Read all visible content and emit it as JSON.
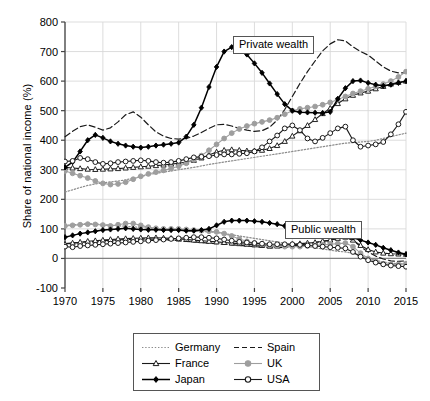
{
  "chart_data": {
    "type": "line",
    "title": "",
    "xlabel": "",
    "ylabel": "Share of national income (%)",
    "xlim": [
      1970,
      2015
    ],
    "ylim": [
      -100,
      800
    ],
    "ytick_values": [
      -100,
      0,
      100,
      200,
      300,
      400,
      500,
      600,
      700,
      800
    ],
    "ytick_labels": [
      "-100",
      "0",
      "100",
      "200",
      "300",
      "400",
      "500",
      "600",
      "700",
      "800"
    ],
    "xtick_values": [
      1970,
      1975,
      1980,
      1985,
      1990,
      1995,
      2000,
      2005,
      2010,
      2015
    ],
    "xtick_labels": [
      "1970",
      "1975",
      "1980",
      "1985",
      "1990",
      "1995",
      "2000",
      "2005",
      "2010",
      "2015"
    ],
    "grid": true,
    "legend_position": "below-center",
    "annotations": [
      {
        "text": "Private wealth",
        "x": 1995,
        "y": 690,
        "name": "private-wealth-label"
      },
      {
        "text": "Public wealth",
        "x": 2002,
        "y": 170,
        "name": "public-wealth-label"
      }
    ],
    "x": [
      1970,
      1971,
      1972,
      1973,
      1974,
      1975,
      1976,
      1977,
      1978,
      1979,
      1980,
      1981,
      1982,
      1983,
      1984,
      1985,
      1986,
      1987,
      1988,
      1989,
      1990,
      1991,
      1992,
      1993,
      1994,
      1995,
      1996,
      1997,
      1998,
      1999,
      2000,
      2001,
      2002,
      2003,
      2004,
      2005,
      2006,
      2007,
      2008,
      2009,
      2010,
      2011,
      2012,
      2013,
      2014,
      2015
    ],
    "groups": [
      {
        "name": "Private wealth",
        "series": [
          {
            "name": "Germany",
            "style": "dotted",
            "color": "#8c8c8c",
            "marker": "none",
            "values": [
              225,
              232,
              240,
              247,
              252,
              256,
              259,
              262,
              266,
              271,
              277,
              283,
              288,
              292,
              296,
              300,
              304,
              308,
              313,
              318,
              322,
              326,
              330,
              334,
              338,
              342,
              346,
              350,
              354,
              358,
              362,
              366,
              370,
              374,
              378,
              382,
              386,
              390,
              392,
              394,
              396,
              400,
              406,
              412,
              418,
              424
            ]
          },
          {
            "name": "Spain",
            "style": "dashed",
            "color": "#1a1a1a",
            "marker": "none",
            "values": [
              412,
              430,
              446,
              452,
              444,
              434,
              442,
              462,
              486,
              496,
              478,
              452,
              428,
              414,
              406,
              404,
              406,
              414,
              426,
              440,
              452,
              454,
              448,
              440,
              434,
              430,
              432,
              444,
              468,
              504,
              548,
              592,
              632,
              668,
              702,
              726,
              740,
              736,
              716,
              700,
              688,
              668,
              648,
              634,
              628,
              628
            ]
          },
          {
            "name": "France",
            "style": "solid",
            "color": "#1a1a1a",
            "marker": "triangle-open",
            "values": [
              308,
              306,
              304,
              302,
              301,
              302,
              303,
              304,
              306,
              308,
              310,
              312,
              314,
              316,
              319,
              322,
              326,
              332,
              340,
              350,
              360,
              366,
              368,
              366,
              364,
              364,
              366,
              372,
              382,
              396,
              414,
              432,
              450,
              470,
              490,
              508,
              524,
              540,
              552,
              560,
              566,
              574,
              582,
              590,
              596,
              600
            ]
          },
          {
            "name": "UK",
            "style": "solid",
            "color": "#9e9e9e",
            "marker": "circle-filled",
            "values": [
              296,
              288,
              280,
              272,
              262,
              254,
              250,
              252,
              258,
              268,
              278,
              286,
              292,
              298,
              304,
              312,
              322,
              334,
              348,
              366,
              386,
              406,
              424,
              438,
              448,
              456,
              462,
              468,
              476,
              488,
              500,
              506,
              510,
              514,
              520,
              528,
              538,
              548,
              558,
              566,
              574,
              582,
              590,
              600,
              614,
              632
            ]
          },
          {
            "name": "Japan",
            "style": "solid",
            "color": "#000000",
            "marker": "diamond-filled",
            "values": [
              308,
              326,
              362,
              400,
              418,
              408,
              396,
              388,
              382,
              378,
              375,
              378,
              382,
              385,
              388,
              392,
              412,
              452,
              510,
              580,
              648,
              700,
              715,
              710,
              690,
              660,
              628,
              592,
              556,
              522,
              500,
              495,
              494,
              493,
              492,
              496,
              540,
              576,
              600,
              602,
              594,
              588,
              584,
              588,
              594,
              600
            ]
          },
          {
            "name": "USA",
            "style": "solid",
            "color": "#1a1a1a",
            "marker": "circle-open",
            "values": [
              328,
              330,
              340,
              336,
              326,
              320,
              322,
              326,
              328,
              330,
              332,
              330,
              326,
              324,
              326,
              330,
              336,
              342,
              344,
              346,
              350,
              352,
              352,
              354,
              356,
              362,
              376,
              396,
              416,
              440,
              450,
              434,
              406,
              396,
              408,
              424,
              440,
              446,
              400,
              378,
              382,
              386,
              394,
              420,
              454,
              496
            ]
          }
        ]
      },
      {
        "name": "Public wealth",
        "series": [
          {
            "name": "Germany",
            "style": "dotted",
            "color": "#8c8c8c",
            "marker": "none",
            "values": [
              112,
              114,
              116,
              118,
              117,
              115,
              113,
              111,
              109,
              107,
              105,
              102,
              100,
              98,
              96,
              94,
              93,
              92,
              91,
              90,
              88,
              84,
              80,
              76,
              72,
              68,
              64,
              60,
              56,
              52,
              48,
              44,
              40,
              36,
              32,
              28,
              24,
              22,
              18,
              8,
              0,
              -6,
              -12,
              -16,
              -18,
              -18
            ]
          },
          {
            "name": "Spain",
            "style": "dashed",
            "color": "#1a1a1a",
            "marker": "none",
            "values": [
              50,
              52,
              54,
              56,
              58,
              60,
              62,
              63,
              64,
              65,
              66,
              66,
              65,
              64,
              62,
              60,
              58,
              56,
              54,
              52,
              50,
              48,
              46,
              44,
              42,
              40,
              38,
              36,
              36,
              38,
              42,
              46,
              50,
              54,
              58,
              62,
              68,
              72,
              62,
              40,
              22,
              8,
              -2,
              -8,
              -10,
              -8
            ]
          },
          {
            "name": "France",
            "style": "solid",
            "color": "#1a1a1a",
            "marker": "triangle-open",
            "values": [
              48,
              52,
              55,
              58,
              60,
              62,
              64,
              66,
              67,
              68,
              69,
              70,
              70,
              69,
              68,
              66,
              64,
              62,
              60,
              58,
              56,
              54,
              52,
              50,
              48,
              46,
              44,
              42,
              42,
              44,
              48,
              50,
              52,
              54,
              58,
              62,
              68,
              72,
              62,
              44,
              30,
              22,
              18,
              16,
              15,
              14
            ]
          },
          {
            "name": "UK",
            "style": "solid",
            "color": "#9e9e9e",
            "marker": "circle-filled",
            "values": [
              110,
              112,
              114,
              116,
              115,
              113,
              110,
              114,
              118,
              118,
              112,
              106,
              102,
              100,
              100,
              100,
              98,
              96,
              94,
              92,
              90,
              84,
              76,
              66,
              58,
              52,
              48,
              44,
              42,
              40,
              40,
              40,
              42,
              44,
              46,
              48,
              50,
              52,
              40,
              18,
              0,
              -10,
              -18,
              -20,
              -20,
              -18
            ]
          },
          {
            "name": "Japan",
            "style": "solid",
            "color": "#000000",
            "marker": "diamond-filled",
            "values": [
              72,
              78,
              84,
              88,
              92,
              96,
              98,
              100,
              102,
              100,
              98,
              97,
              97,
              96,
              96,
              96,
              94,
              94,
              96,
              100,
              112,
              124,
              128,
              128,
              128,
              126,
              124,
              120,
              116,
              110,
              104,
              98,
              94,
              90,
              86,
              82,
              80,
              78,
              70,
              62,
              54,
              46,
              36,
              28,
              20,
              14
            ]
          },
          {
            "name": "USA",
            "style": "solid",
            "color": "#1a1a1a",
            "marker": "circle-open",
            "values": [
              40,
              38,
              42,
              44,
              46,
              48,
              50,
              52,
              54,
              56,
              58,
              60,
              62,
              64,
              66,
              68,
              70,
              72,
              72,
              70,
              68,
              64,
              60,
              56,
              54,
              52,
              50,
              48,
              48,
              48,
              48,
              46,
              44,
              42,
              40,
              38,
              36,
              34,
              22,
              6,
              -6,
              -14,
              -20,
              -24,
              -26,
              -28
            ]
          }
        ]
      }
    ]
  },
  "legend": {
    "items": [
      {
        "label": "Germany",
        "marker": "none",
        "style": "dotted",
        "color": "#8c8c8c"
      },
      {
        "label": "Spain",
        "marker": "none",
        "style": "dashed",
        "color": "#1a1a1a"
      },
      {
        "label": "France",
        "marker": "triangle-open",
        "style": "solid",
        "color": "#1a1a1a"
      },
      {
        "label": "UK",
        "marker": "circle-filled",
        "style": "solid",
        "color": "#9e9e9e"
      },
      {
        "label": "Japan",
        "marker": "diamond-filled",
        "style": "solid",
        "color": "#000000"
      },
      {
        "label": "USA",
        "marker": "circle-open",
        "style": "solid",
        "color": "#1a1a1a"
      }
    ]
  },
  "colors": {
    "axis": "#444444",
    "grid": "#d9d9d9",
    "zero_line": "#808080",
    "background": "#ffffff"
  }
}
